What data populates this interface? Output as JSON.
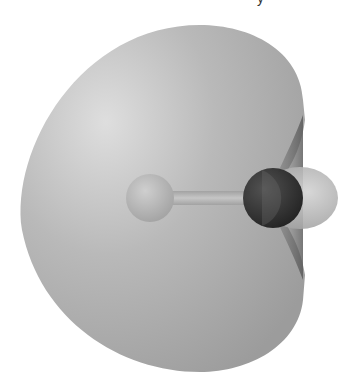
{
  "figure": {
    "caption_fragment": "y",
    "colors": {
      "background": "#ffffff",
      "lobe_highlight": "#dcdcdc",
      "lobe_base": "#a8a8a8",
      "lobe_edge": "#8a8a8a",
      "inner_lobe": "#5a5a5a",
      "atom_left": "#b4b4b4",
      "atom_right": "#1e1e1e",
      "small_lobe": "#bdbdbd",
      "bond": "#b0b0b0"
    },
    "atoms": [
      {
        "name": "left-atom",
        "cx": 150,
        "cy": 198,
        "r": 24
      },
      {
        "name": "right-atom",
        "cx": 273,
        "cy": 198,
        "r": 30
      }
    ],
    "small_lobe": {
      "cx": 300,
      "cy": 198,
      "rx": 38,
      "ry": 31
    }
  }
}
